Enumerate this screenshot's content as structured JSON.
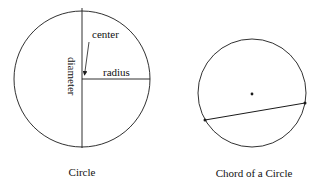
{
  "figures": [
    {
      "name": "circle",
      "caption": "Circle",
      "labels": {
        "center": "center",
        "radius": "radius",
        "diameter": "diameter"
      }
    },
    {
      "name": "chord-of-a-circle",
      "caption": "Chord of a Circle"
    }
  ],
  "colors": {
    "stroke": "#1a1a1a",
    "background": "#ffffff"
  }
}
